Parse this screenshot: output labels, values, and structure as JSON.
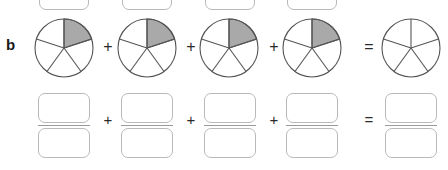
{
  "figure": {
    "part_label": "b",
    "type": "fraction-addition-worksheet",
    "denominator": 5,
    "colors": {
      "shaded_slice": "#a9a9a9",
      "pie_outline": "#555555",
      "box_outline": "#b9b9b9",
      "operator": "#2b2b2b",
      "background": "#ffffff"
    },
    "top_row": {
      "name": "pie-diagram-row",
      "pies": [
        {
          "id": "pie-1",
          "slices": 5,
          "shaded": 1,
          "cx": 64,
          "cy": 48,
          "r": 29
        },
        {
          "id": "pie-2",
          "slices": 5,
          "shaded": 1,
          "cx": 147,
          "cy": 48,
          "r": 29
        },
        {
          "id": "pie-3",
          "slices": 5,
          "shaded": 1,
          "cx": 229,
          "cy": 48,
          "r": 29
        },
        {
          "id": "pie-4",
          "slices": 5,
          "shaded": 1,
          "cx": 312,
          "cy": 48,
          "r": 29
        },
        {
          "id": "pie-result",
          "slices": 5,
          "shaded": 0,
          "cx": 411,
          "cy": 48,
          "r": 29
        }
      ],
      "operators": [
        {
          "symbol": "+",
          "x": 100
        },
        {
          "symbol": "+",
          "x": 183
        },
        {
          "symbol": "+",
          "x": 266
        },
        {
          "symbol": "=",
          "x": 366
        }
      ]
    },
    "top_cut_boxes": {
      "name": "partial-answer-boxes-above",
      "count": 4,
      "value": "",
      "placeholder": "",
      "x_positions": [
        39,
        122,
        205,
        287
      ]
    },
    "bottom_row": {
      "name": "fraction-answer-row",
      "fractions": [
        {
          "id": "fraction-1",
          "numerator": "",
          "denominator": "",
          "x": 38
        },
        {
          "id": "fraction-2",
          "numerator": "",
          "denominator": "",
          "x": 121
        },
        {
          "id": "fraction-3",
          "numerator": "",
          "denominator": "",
          "x": 204
        },
        {
          "id": "fraction-4",
          "numerator": "",
          "denominator": "",
          "x": 286
        },
        {
          "id": "fraction-result",
          "numerator": "",
          "denominator": "",
          "x": 385
        }
      ],
      "operators": [
        {
          "symbol": "+",
          "x": 100
        },
        {
          "symbol": "+",
          "x": 183
        },
        {
          "symbol": "+",
          "x": 266
        },
        {
          "symbol": "=",
          "x": 366
        }
      ]
    }
  }
}
